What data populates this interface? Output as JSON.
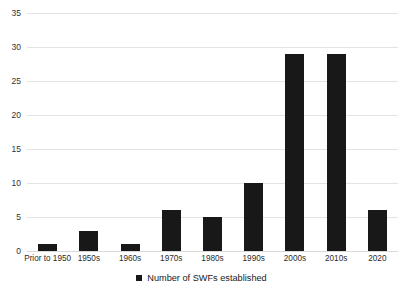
{
  "chart_data": {
    "type": "bar",
    "title": "",
    "subtitle": "",
    "xlabel": "",
    "ylabel": "",
    "categories": [
      "Prior to 1950",
      "1950s",
      "1960s",
      "1970s",
      "1980s",
      "1990s",
      "2000s",
      "2010s",
      "2020"
    ],
    "series": [
      {
        "name": "Number of SWFs established",
        "values": [
          1,
          3,
          1,
          6,
          5,
          10,
          29,
          29,
          6
        ],
        "color": "#181818"
      }
    ],
    "ylim": [
      0,
      35
    ],
    "yticks": [
      0,
      5,
      10,
      15,
      20,
      25,
      30,
      35
    ],
    "ytick_labels": [
      "0",
      "5",
      "10",
      "15",
      "20",
      "25",
      "30",
      "35"
    ],
    "grid": true,
    "grid_axis": "y",
    "grid_color": "#e3e3e3",
    "legend": {
      "position": "bottom",
      "entries": [
        {
          "label": "Number of SWFs established",
          "marker": "square-marker",
          "color": "#181818"
        }
      ]
    }
  }
}
